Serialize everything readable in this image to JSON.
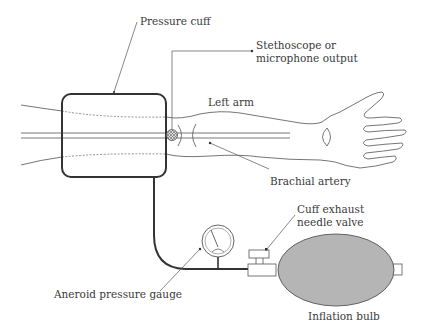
{
  "diagram": {
    "colors": {
      "line": "#333333",
      "text": "#3a3a3a",
      "bulb_fill": "#b5b5b5",
      "bulb_stroke": "#555555",
      "hatch": "#666666"
    },
    "labels": {
      "pressure_cuff": "Pressure cuff",
      "stethoscope_line1": "Stethoscope or",
      "stethoscope_line2": "microphone output",
      "left_arm": "Left arm",
      "brachial_artery": "Brachial artery",
      "cuff_exhaust_line1": "Cuff exhaust",
      "cuff_exhaust_line2": "needle valve",
      "aneroid_gauge": "Aneroid pressure gauge",
      "inflation_bulb": "Inflation bulb"
    },
    "components": [
      {
        "name": "Pressure cuff",
        "icon": "cuff-rectangle"
      },
      {
        "name": "Stethoscope or microphone",
        "icon": "hatched-circle"
      },
      {
        "name": "Left arm",
        "icon": "arm-outline"
      },
      {
        "name": "Brachial artery",
        "icon": "parallel-lines"
      },
      {
        "name": "Aneroid pressure gauge",
        "icon": "dial-gauge"
      },
      {
        "name": "Cuff exhaust needle valve",
        "icon": "valve-block"
      },
      {
        "name": "Inflation bulb",
        "icon": "filled-ellipse"
      }
    ]
  }
}
